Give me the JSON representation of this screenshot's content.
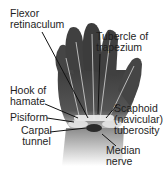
{
  "figure": {
    "labels": {
      "flexor_retinaculum": "Flexor\nretinaculum",
      "tubercle_of_trapezium": "Tubercle of\ntrapezium",
      "hook_of_hamate": "Hook of\nhamate",
      "pisiform": "Pisiform",
      "carpal_tunnel": "Carpal\ntunnel",
      "scaphoid_tuberosity": "Scaphoid\n(navicular)\ntuberosity",
      "median_nerve": "Median\nnerve"
    },
    "colors": {
      "hand_dark": "#4a4a4a",
      "hand_mid": "#7a7a7a",
      "tendon": "#cfcfcf",
      "bone_highlight": "#e8e8e8",
      "leader_line": "#111111"
    }
  }
}
